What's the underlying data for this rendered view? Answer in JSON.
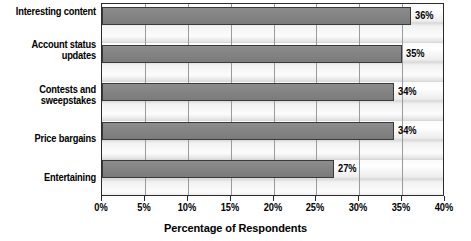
{
  "chart_data": {
    "type": "bar",
    "orientation": "horizontal",
    "title": "",
    "subtitle": "",
    "xlabel": "Percentage of Respondents",
    "ylabel": "",
    "categories": [
      "Interesting content",
      "Account status updates",
      "Contests and sweepstakes",
      "Price bargains",
      "Entertaining"
    ],
    "values": [
      36,
      35,
      34,
      34,
      27
    ],
    "data_labels": [
      "36%",
      "35%",
      "34%",
      "34%",
      "27%"
    ],
    "xlim": [
      0,
      40
    ],
    "xticks": [
      0,
      5,
      10,
      15,
      20,
      25,
      30,
      35,
      40
    ],
    "xtick_labels": [
      "0%",
      "5%",
      "10%",
      "15%",
      "20%",
      "25%",
      "30%",
      "35%",
      "40%"
    ],
    "grid": "vertical",
    "legend": "none",
    "bar_color": "#848484",
    "bar_edge_color": "#3a3a3a",
    "plot_border_color": "#2b2b2b",
    "text_color": "#000000"
  },
  "categories_display": [
    {
      "line1": "Interesting content",
      "line2": ""
    },
    {
      "line1": "Account status",
      "line2": "updates"
    },
    {
      "line1": "Contests and",
      "line2": "sweepstakes"
    },
    {
      "line1": "Price bargains",
      "line2": ""
    },
    {
      "line1": "Entertaining",
      "line2": ""
    }
  ]
}
